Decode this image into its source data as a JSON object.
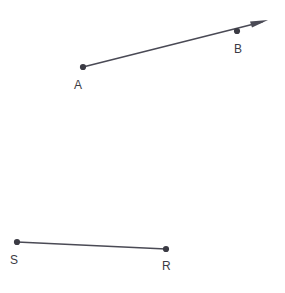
{
  "figure": {
    "background_color": "#ffffff",
    "stroke_color": "#4a4a55",
    "point_color": "#3b3b44",
    "label_color": "#3b3b44",
    "width": 285,
    "height": 293
  },
  "shapes": {
    "ray_ab": {
      "kind": "ray",
      "name": "ray-ab",
      "start_label": "A",
      "through_label": "B",
      "has_arrowhead": true,
      "arrow_direction": "upper-right",
      "start": {
        "x": 83,
        "y": 67
      },
      "through": {
        "x": 237,
        "y": 31
      },
      "arrow_tip": {
        "x": 268,
        "y": 20
      }
    },
    "segment_sr": {
      "kind": "segment",
      "name": "segment-sr",
      "start_label": "S",
      "end_label": "R",
      "has_arrowhead": false,
      "start": {
        "x": 17,
        "y": 242
      },
      "end": {
        "x": 166,
        "y": 249
      }
    }
  },
  "points": [
    {
      "id": "A",
      "label": "A",
      "x": 83,
      "y": 67,
      "label_x": 74,
      "label_y": 89
    },
    {
      "id": "B",
      "label": "B",
      "x": 237,
      "y": 31,
      "label_x": 234,
      "label_y": 53
    },
    {
      "id": "S",
      "label": "S",
      "x": 17,
      "y": 242,
      "label_x": 10,
      "label_y": 264
    },
    {
      "id": "R",
      "label": "R",
      "x": 166,
      "y": 249,
      "label_x": 162,
      "label_y": 270
    }
  ],
  "labels": {
    "a": "A",
    "b": "B",
    "s": "S",
    "r": "R"
  }
}
